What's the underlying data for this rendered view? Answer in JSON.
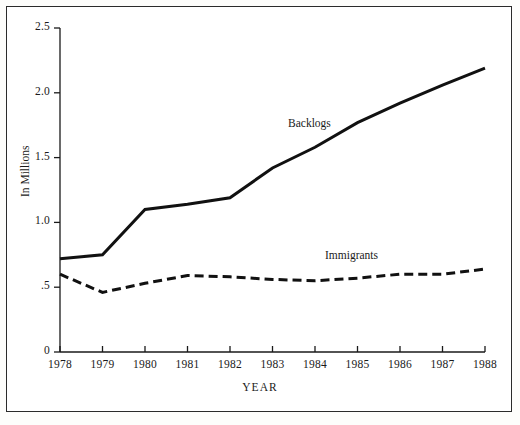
{
  "figure": {
    "background_color": "#ffffff",
    "border_color": "#2b2b2b",
    "line_color": "#111111"
  },
  "axes": {
    "y_title": "In Millions",
    "x_title": "YEAR",
    "y_ticks": [
      "0",
      ".5",
      "1.0",
      "1.5",
      "2.0",
      "2.5"
    ],
    "x_ticks": [
      "1978",
      "1979",
      "1980",
      "1981",
      "1982",
      "1983",
      "1984",
      "1985",
      "1986",
      "1987",
      "1988"
    ]
  },
  "labels": {
    "backlogs": "Backlogs",
    "immigrants": "Immigrants"
  },
  "chart_data": {
    "type": "line",
    "title": "",
    "xlabel": "YEAR",
    "ylabel": "In Millions",
    "xlim": [
      1978,
      1988
    ],
    "ylim": [
      0,
      2.5
    ],
    "ytick_values": [
      0,
      0.5,
      1.0,
      1.5,
      2.0,
      2.5
    ],
    "ytick_labels": [
      "0",
      ".5",
      "1.0",
      "1.5",
      "2.0",
      "2.5"
    ],
    "grid": false,
    "legend_position": "inline-annotations",
    "x": [
      1978,
      1979,
      1980,
      1981,
      1982,
      1983,
      1984,
      1985,
      1986,
      1987,
      1988
    ],
    "series": [
      {
        "name": "Backlogs",
        "style": "solid",
        "width": 3,
        "values": [
          0.72,
          0.75,
          1.1,
          1.14,
          1.19,
          1.42,
          1.58,
          1.77,
          1.92,
          2.06,
          2.19
        ]
      },
      {
        "name": "Immigrants",
        "style": "dashed",
        "width": 3,
        "values": [
          0.6,
          0.46,
          0.53,
          0.59,
          0.58,
          0.56,
          0.55,
          0.57,
          0.6,
          0.6,
          0.64
        ]
      }
    ]
  }
}
